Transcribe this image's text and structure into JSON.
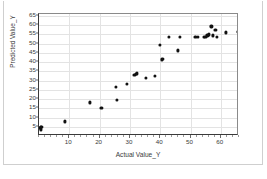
{
  "chart_data": {
    "type": "scatter",
    "title": "",
    "xlabel": "Actual Value_Y",
    "ylabel": "Predicted Value_Y",
    "xlim": [
      0,
      66
    ],
    "ylim": [
      0,
      66
    ],
    "xticks": [
      10,
      20,
      30,
      40,
      50,
      60
    ],
    "yticks": [
      5,
      10,
      15,
      20,
      25,
      30,
      35,
      40,
      45,
      50,
      55,
      60,
      65
    ],
    "grid": true,
    "legend": "none",
    "marker_color": "#111111",
    "points": [
      {
        "x": 0.4,
        "y": 4.2
      },
      {
        "x": 0.5,
        "y": 4.8
      },
      {
        "x": 0.6,
        "y": 3.6
      },
      {
        "x": 0.8,
        "y": 5.0
      },
      {
        "x": 8.6,
        "y": 7.9
      },
      {
        "x": 16.8,
        "y": 18.2
      },
      {
        "x": 20.6,
        "y": 15.2
      },
      {
        "x": 25.4,
        "y": 26.6
      },
      {
        "x": 25.7,
        "y": 19.4
      },
      {
        "x": 28.9,
        "y": 28.4
      },
      {
        "x": 31.5,
        "y": 33.2
      },
      {
        "x": 32.0,
        "y": 33.6
      },
      {
        "x": 32.4,
        "y": 33.9
      },
      {
        "x": 35.3,
        "y": 31.3
      },
      {
        "x": 38.2,
        "y": 32.4
      },
      {
        "x": 39.8,
        "y": 49.3
      },
      {
        "x": 40.6,
        "y": 41.4
      },
      {
        "x": 40.9,
        "y": 41.9
      },
      {
        "x": 42.8,
        "y": 53.6
      },
      {
        "x": 45.9,
        "y": 46.3
      },
      {
        "x": 46.4,
        "y": 53.6
      },
      {
        "x": 51.6,
        "y": 53.4
      },
      {
        "x": 52.4,
        "y": 53.5
      },
      {
        "x": 54.3,
        "y": 53.5
      },
      {
        "x": 54.9,
        "y": 53.7
      },
      {
        "x": 55.6,
        "y": 54.4
      },
      {
        "x": 56.1,
        "y": 55.0
      },
      {
        "x": 56.9,
        "y": 59.3
      },
      {
        "x": 57.4,
        "y": 54.4
      },
      {
        "x": 58.2,
        "y": 57.6
      },
      {
        "x": 58.6,
        "y": 53.8
      },
      {
        "x": 61.8,
        "y": 56.0
      },
      {
        "x": 65.8,
        "y": 56.2
      }
    ]
  }
}
